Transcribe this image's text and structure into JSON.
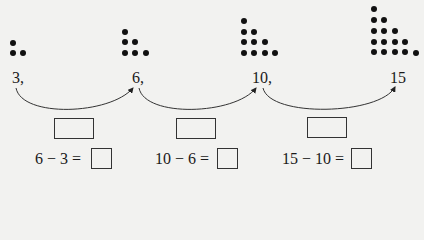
{
  "sequence": {
    "terms": [
      {
        "label": "3,",
        "value": 3,
        "dot_rows": [
          1,
          2
        ]
      },
      {
        "label": "6,",
        "value": 6,
        "dot_rows": [
          1,
          2,
          3
        ]
      },
      {
        "label": "10,",
        "value": 10,
        "dot_rows": [
          1,
          2,
          3,
          4
        ]
      },
      {
        "label": "15",
        "value": 15,
        "dot_rows": [
          1,
          2,
          3,
          4,
          5
        ]
      }
    ]
  },
  "differences": {
    "boxes": [
      "",
      "",
      ""
    ],
    "equations": [
      {
        "expr": "6 − 3 =",
        "answer": ""
      },
      {
        "expr": "10 − 6 =",
        "answer": ""
      },
      {
        "expr": "15 − 10 =",
        "answer": ""
      }
    ]
  },
  "colors": {
    "ink": "#111111",
    "paper": "#f2f2f0"
  }
}
